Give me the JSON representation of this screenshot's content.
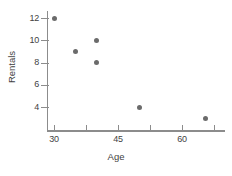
{
  "chart_data": {
    "type": "scatter",
    "title": "",
    "xlabel": "Age",
    "ylabel": "Rentals",
    "xlim": [
      27,
      69
    ],
    "ylim": [
      2,
      13
    ],
    "grid": false,
    "legend": null,
    "x_ticks": [
      {
        "value": 30,
        "label": "30"
      },
      {
        "value": 37.5,
        "label": ""
      },
      {
        "value": 45,
        "label": "45"
      },
      {
        "value": 52.5,
        "label": ""
      },
      {
        "value": 60,
        "label": "60"
      },
      {
        "value": 67.5,
        "label": ""
      }
    ],
    "y_ticks": [
      {
        "value": 12,
        "label": "12"
      },
      {
        "value": 10,
        "label": "10"
      },
      {
        "value": 8,
        "label": "8"
      },
      {
        "value": 6,
        "label": "6"
      },
      {
        "value": 4,
        "label": "4"
      }
    ],
    "points": [
      {
        "x": 30,
        "y": 12
      },
      {
        "x": 35,
        "y": 9
      },
      {
        "x": 40,
        "y": 10
      },
      {
        "x": 40,
        "y": 8
      },
      {
        "x": 50,
        "y": 4
      },
      {
        "x": 65.5,
        "y": 3
      }
    ],
    "marker_color": "#6b6b6b",
    "axis_color": "#8c8c8c",
    "text_color": "#3f3f3f",
    "background_color": "#ffffff"
  }
}
